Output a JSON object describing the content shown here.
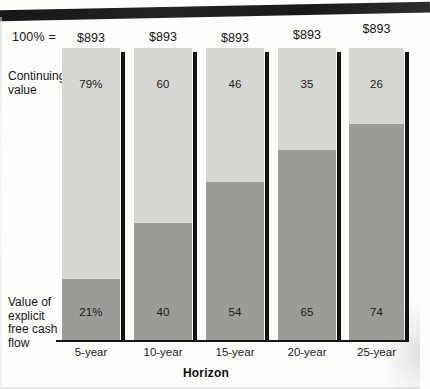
{
  "chart_data": {
    "type": "bar",
    "subtype": "stacked-100-percent",
    "title": "",
    "xlabel": "Horizon",
    "ylabel": "",
    "categories": [
      "5-year",
      "10-year",
      "15-year",
      "20-year",
      "25-year"
    ],
    "series": [
      {
        "name": "Continuing value",
        "values": [
          79,
          60,
          46,
          35,
          26
        ],
        "value_labels": [
          "79%",
          "60",
          "46",
          "35",
          "26"
        ],
        "color": "#d6d6d3"
      },
      {
        "name": "Value of explicit free cash flow",
        "values": [
          21,
          40,
          54,
          65,
          74
        ],
        "value_labels": [
          "21%",
          "40",
          "54",
          "65",
          "74"
        ],
        "color": "#9b9b98"
      }
    ],
    "totals": [
      "$893",
      "$893",
      "$893",
      "$893",
      "$893"
    ],
    "total_note": "100%  =",
    "ylim": [
      0,
      100
    ],
    "grid": false,
    "legend": "inline-left-labels",
    "units": "percent of total value; totals in $ millions"
  },
  "labels": {
    "percent_note": "100%  =",
    "continuing_value": "Continuing\nvalue",
    "continuing_value_line1": "Continuing",
    "continuing_value_line2": "value",
    "explicit_line1": "Value of",
    "explicit_line2": "explicit",
    "explicit_line3": "free cash",
    "explicit_line4": "flow",
    "axis_title": "Horizon"
  }
}
